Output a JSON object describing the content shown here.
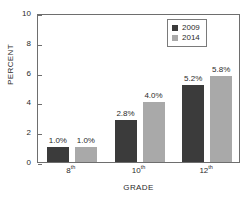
{
  "chart_data": {
    "type": "bar",
    "title": "",
    "subtitle": "",
    "xlabel": "GRADE",
    "ylabel": "PERCENT",
    "categories": [
      "8th",
      "10th",
      "12th"
    ],
    "category_bases": [
      "8",
      "10",
      "12"
    ],
    "category_suffixes": [
      "th",
      "th",
      "th"
    ],
    "series": [
      {
        "name": "2009",
        "color": "#3b3b3b",
        "values": [
          1.0,
          2.8,
          5.2
        ],
        "labels": [
          "1.0%",
          "2.8%",
          "5.2%"
        ]
      },
      {
        "name": "2014",
        "color": "#a9a9a9",
        "values": [
          1.0,
          4.0,
          5.8
        ],
        "labels": [
          "1.0%",
          "4.0%",
          "5.8%"
        ]
      }
    ],
    "ylim": [
      0,
      10
    ],
    "yticks": [
      0,
      2,
      4,
      6,
      8,
      10
    ],
    "ytick_labels": [
      "0",
      "2",
      "4",
      "6",
      "8",
      "10"
    ],
    "grid": false,
    "legend_position": "top-right",
    "legend_entries": [
      "2009",
      "2014"
    ]
  },
  "axes": {
    "y_title": "PERCENT",
    "x_title": "GRADE"
  },
  "legend": {
    "items": [
      {
        "label": "2009"
      },
      {
        "label": "2014"
      }
    ]
  }
}
